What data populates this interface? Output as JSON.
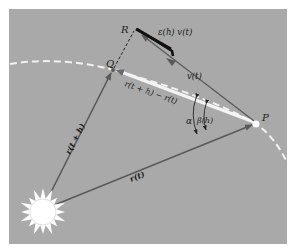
{
  "figure": {
    "background": "#ffffff",
    "panel_color": "#a9a9a9",
    "orbit_color": "#f2f2f2",
    "vector_color": "#5a5a5a",
    "chord_color": "#f4f4f4",
    "error_bar_color": "#111111",
    "sun_color": "#ffffff"
  },
  "points": {
    "P": "P",
    "Q": "Q",
    "R": "R"
  },
  "labels": {
    "r_t": "r(t)",
    "r_t_plus_h": "r(t + h)",
    "chord": "r(t + h) − r(t)",
    "velocity": "v(t)",
    "error_term": "ε(h) v(t)",
    "alpha": "α",
    "beta": "β(h)"
  }
}
